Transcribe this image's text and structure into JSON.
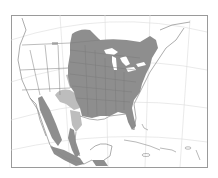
{
  "map": {
    "type": "species range map",
    "region": "North America",
    "projection": "conic with graticule",
    "legend": {
      "primary_range": "dark gray",
      "secondary_range": "light gray"
    },
    "colors": {
      "background": "#ffffff",
      "frame": "#9a9a9a",
      "graticule": "#d8d8d8",
      "borders": "#a8a8a8",
      "primary_range": "#8e8e8e",
      "secondary_range": "#bdbdbd",
      "state_lines": "#6e6e6e",
      "lakes": "#ffffff"
    },
    "frame": {
      "x": 11,
      "y": 15,
      "width": 196,
      "height": 152
    }
  }
}
